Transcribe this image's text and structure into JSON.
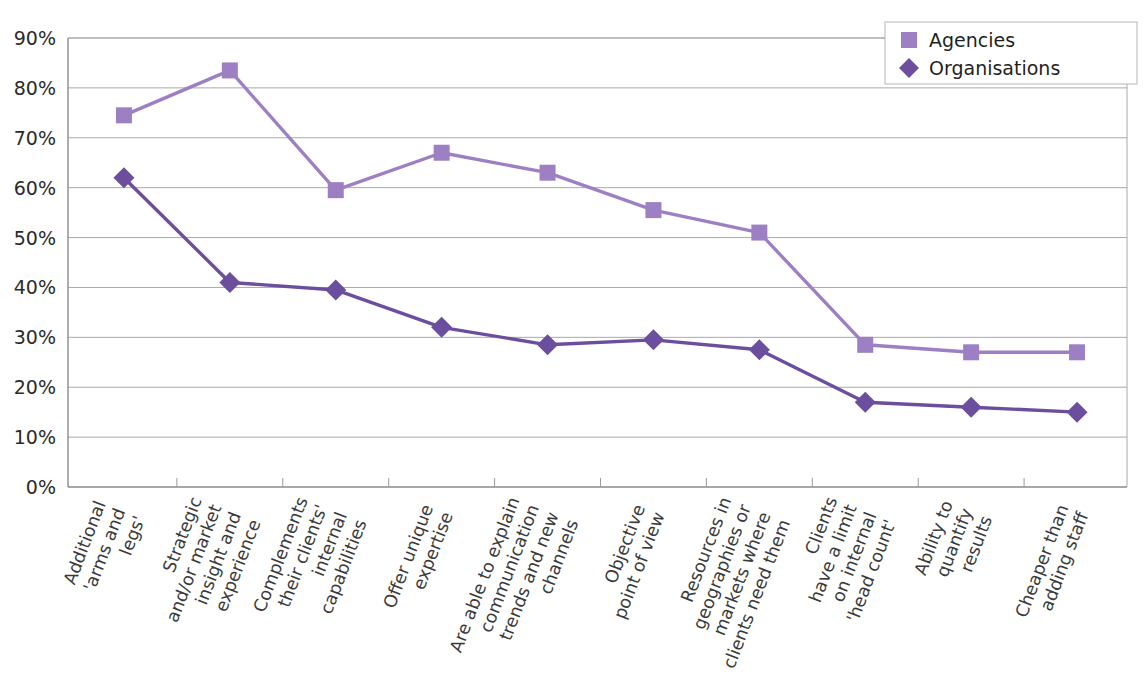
{
  "chart_data": {
    "type": "line",
    "title": "",
    "subtitle": "",
    "xlabel": "",
    "ylabel": "",
    "ylim": [
      0,
      90
    ],
    "ytick_values": [
      0,
      10,
      20,
      30,
      40,
      50,
      60,
      70,
      80,
      90
    ],
    "ytick_labels": [
      "0%",
      "10%",
      "20%",
      "30%",
      "40%",
      "50%",
      "60%",
      "70%",
      "80%",
      "90%"
    ],
    "grid": true,
    "legend_position": "top-right",
    "categories": [
      "Additional 'arms and legs'",
      "Strategic and/or market insight and experience",
      "Complements their clients' internal capabilities",
      "Offer unique expertise",
      "Are able to explain communication trends and new channels",
      "Objective point of view",
      "Resources in geographies or markets where clients need them",
      "Clients have a limit on internal 'head count'",
      "Ability to quantify results",
      "Cheaper than adding staff"
    ],
    "category_lines": [
      [
        "Additional",
        "'arms and",
        "legs'"
      ],
      [
        "Strategic",
        "and/or market",
        "insight and",
        "experience"
      ],
      [
        "Complements",
        "their clients'",
        "internal",
        "capabilities"
      ],
      [
        "Offer unique",
        "expertise"
      ],
      [
        "Are able to explain",
        "communication",
        "trends and new",
        "channels"
      ],
      [
        "Objective",
        "point of view"
      ],
      [
        "Resources in",
        "geographies or",
        "markets where",
        "clients need them"
      ],
      [
        "Clients",
        "have a limit",
        "on internal",
        "'head count'"
      ],
      [
        "Ability to",
        "quantify",
        "results"
      ],
      [
        "Cheaper than",
        "adding staff"
      ]
    ],
    "series": [
      {
        "name": "Agencies",
        "color": "#9d80c3",
        "marker": "square",
        "values": [
          74.5,
          83.5,
          59.5,
          67.0,
          63.0,
          55.5,
          51.0,
          28.5,
          27.0,
          27.0
        ]
      },
      {
        "name": "Organisations",
        "color": "#6b4e9e",
        "marker": "diamond",
        "values": [
          62.0,
          41.0,
          39.5,
          32.0,
          28.5,
          29.5,
          27.5,
          17.0,
          16.0,
          15.0
        ]
      }
    ]
  },
  "legend": {
    "items": [
      {
        "label": "Agencies",
        "marker": "square",
        "color": "#9d80c3"
      },
      {
        "label": "Organisations",
        "marker": "diamond",
        "color": "#6b4e9e"
      }
    ]
  },
  "axes": {
    "y": {
      "ticks": [
        "90%",
        "80%",
        "70%",
        "60%",
        "50%",
        "40%",
        "30%",
        "20%",
        "10%",
        "0%"
      ]
    }
  }
}
